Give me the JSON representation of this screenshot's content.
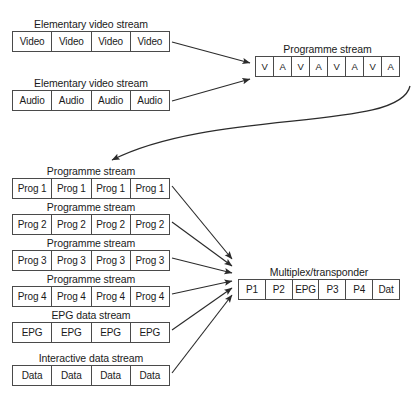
{
  "diagram": {
    "title_visible": false,
    "background_color": "#ffffff",
    "line_color": "#4a4a4a",
    "text_color": "#1a1a1a",
    "streams": [
      {
        "id": "elementary-video-stream",
        "label": "Elementary video stream",
        "cells": [
          "Video",
          "Video",
          "Video",
          "Video"
        ],
        "x": 12,
        "y": 18,
        "width": 158
      },
      {
        "id": "elementary-audio-stream",
        "label": "Elementary video stream",
        "cells": [
          "Audio",
          "Audio",
          "Audio",
          "Audio"
        ],
        "x": 12,
        "y": 77,
        "width": 158
      },
      {
        "id": "programme-stream-va",
        "label": "Programme stream",
        "cells": [
          "V",
          "A",
          "V",
          "A",
          "V",
          "A",
          "V",
          "A"
        ],
        "x": 255,
        "y": 43,
        "width": 145
      },
      {
        "id": "programme-stream-1",
        "label": "Programme stream",
        "cells": [
          "Prog 1",
          "Prog 1",
          "Prog 1",
          "Prog 1"
        ],
        "x": 12,
        "y": 165,
        "width": 158
      },
      {
        "id": "programme-stream-2",
        "label": "Programme stream",
        "cells": [
          "Prog 2",
          "Prog 2",
          "Prog 2",
          "Prog 2"
        ],
        "x": 12,
        "y": 201,
        "width": 158
      },
      {
        "id": "programme-stream-3",
        "label": "Programme stream",
        "cells": [
          "Prog 3",
          "Prog 3",
          "Prog 3",
          "Prog 3"
        ],
        "x": 12,
        "y": 237,
        "width": 158
      },
      {
        "id": "programme-stream-4",
        "label": "Programme stream",
        "cells": [
          "Prog 4",
          "Prog 4",
          "Prog 4",
          "Prog 4"
        ],
        "x": 12,
        "y": 273,
        "width": 158
      },
      {
        "id": "epg-data-stream",
        "label": "EPG data stream",
        "cells": [
          "EPG",
          "EPG",
          "EPG",
          "EPG"
        ],
        "x": 12,
        "y": 309,
        "width": 158
      },
      {
        "id": "interactive-data-stream",
        "label": "Interactive data stream",
        "cells": [
          "Data",
          "Data",
          "Data",
          "Data"
        ],
        "x": 12,
        "y": 352,
        "width": 158
      },
      {
        "id": "multiplex-transponder",
        "label": "Multiplex/transponder",
        "cells": [
          "P1",
          "P2",
          "EPG",
          "P3",
          "P4",
          "Dat"
        ],
        "x": 238,
        "y": 266,
        "width": 162
      }
    ]
  }
}
